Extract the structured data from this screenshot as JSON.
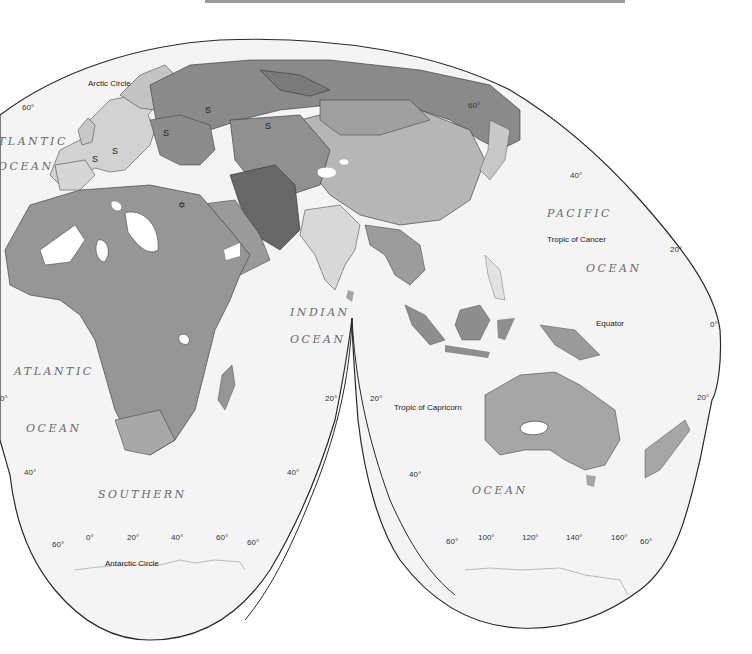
{
  "page": {
    "page_number": "",
    "header_text_cropped": true
  },
  "map": {
    "type": "thematic world map",
    "projection": "interrupted homolosine",
    "colors": {
      "ocean": "#f4f4f4",
      "land_light": "#d2d2d2",
      "land_medium": "#a6a6a6",
      "land_dark": "#7e7e7e",
      "land_darkest": "#676767",
      "uninhabited": "#ffffff",
      "border": "#333333",
      "outline": "#2a2a2a"
    },
    "reference_lines": {
      "arctic_circle": "Arctic Circle",
      "tropic_cancer": "Tropic of Cancer",
      "equator": "Equator",
      "tropic_capricorn": "Tropic of Capricorn",
      "antarctic_circle": "Antarctic Circle"
    },
    "oceans": {
      "atlantic_north_1": "TLANTIC",
      "atlantic_north_2": "OCEAN",
      "atlantic_south_1": "ATLANTIC",
      "atlantic_south_2": "OCEAN",
      "indian_1": "INDIAN",
      "indian_2": "OCEAN",
      "pacific_1": "PACIFIC",
      "pacific_2": "OCEAN",
      "southern": "SOUTHERN",
      "southern_ocean_east": "OCEAN"
    },
    "latitude_labels": {
      "left_60n": "60°",
      "right_60n": "60°",
      "east_40n": "40°",
      "east_20n": "20°",
      "east_0": "0°",
      "east_20s": "20°",
      "west_20s": "0°",
      "left_40s": "40°",
      "gap_20s_left": "20°",
      "gap_20s_right": "20°",
      "gap_40s_left": "40°",
      "gap_40s_right": "40°",
      "south_60s_left_a": "60°",
      "south_60s_left_b": "60°",
      "south_60s_right_a": "60°",
      "south_60s_right_b": "60°"
    },
    "longitude_labels": {
      "west": [
        "0°",
        "20°",
        "40°",
        "60°"
      ],
      "east": [
        "100°",
        "120°",
        "140°",
        "160°"
      ]
    },
    "symbols": {
      "s_marker": "S",
      "star_marker": "✡"
    }
  }
}
